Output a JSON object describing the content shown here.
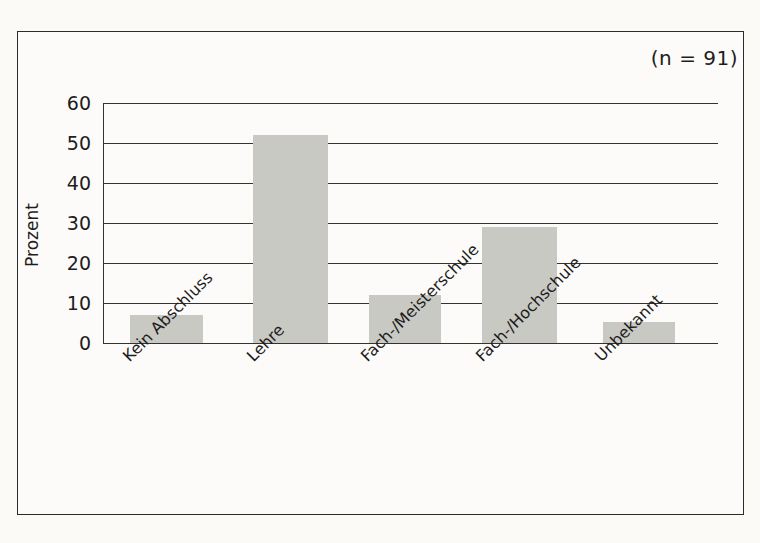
{
  "annotation": {
    "sample_size": "(n = 91)"
  },
  "axes": {
    "y_title": "Prozent",
    "y_ticks": [
      "0",
      "10",
      "20",
      "30",
      "40",
      "50",
      "60"
    ]
  },
  "colors": {
    "bar_fill": "#c9c9c4",
    "axis": "#33332f",
    "frame": "#2b2b2b",
    "background": "#fbfaf7"
  },
  "chart_data": {
    "type": "bar",
    "title": "",
    "subtitle": "",
    "xlabel": "",
    "ylabel": "Prozent",
    "ylim": [
      0,
      60
    ],
    "ytick_step": 10,
    "grid": true,
    "legend": false,
    "annotations": [
      "(n = 91)"
    ],
    "categories": [
      "Kein Abschluss",
      "Lehre",
      "Fach-/Meisterschule",
      "Fach-/Hochschule",
      "Unbekannt"
    ],
    "values": [
      7,
      52,
      12,
      29,
      5.3
    ],
    "series": [
      {
        "name": "Prozent",
        "values": [
          7,
          52,
          12,
          29,
          5.3
        ]
      }
    ]
  }
}
